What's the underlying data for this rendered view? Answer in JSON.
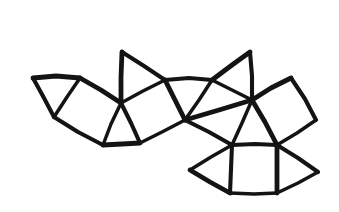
{
  "figure": {
    "style": "hand-drawn line art",
    "background_color": "#ffffff",
    "ink_color": "#141414",
    "stroke_width": 4.1,
    "canvas": {
      "width": 339,
      "height": 212
    }
  },
  "geometry": {
    "vertices": {
      "a": [
        33,
        78
      ],
      "b": [
        80,
        78
      ],
      "c": [
        54,
        117
      ],
      "d": [
        103,
        145
      ],
      "e": [
        121,
        103
      ],
      "f": [
        140,
        143
      ],
      "g": [
        122,
        52
      ],
      "h": [
        165,
        80
      ],
      "i": [
        212,
        80
      ],
      "j": [
        250,
        52
      ],
      "k": [
        185,
        120
      ],
      "l": [
        252,
        100
      ],
      "m": [
        232,
        145
      ],
      "n": [
        291,
        78
      ],
      "o": [
        316,
        120
      ],
      "p": [
        277,
        145
      ],
      "q": [
        190,
        170
      ],
      "r": [
        230,
        193
      ],
      "s": [
        277,
        193
      ],
      "t": [
        318,
        172
      ]
    },
    "faces": [
      {
        "name": "triangle-far-left",
        "shape": "triangle",
        "points": "a,c,b"
      },
      {
        "name": "square-left",
        "shape": "square",
        "points": "b,e,d,c"
      },
      {
        "name": "triangle-left-lower",
        "shape": "triangle",
        "points": "e,f,d"
      },
      {
        "name": "square-center-left",
        "shape": "square",
        "points": "e,h,k,f"
      },
      {
        "name": "triangle-upper-left",
        "shape": "triangle",
        "points": "g,h,e"
      },
      {
        "name": "square-top",
        "shape": "square",
        "points": "h,i,l,k"
      },
      {
        "name": "triangle-top-left",
        "shape": "triangle",
        "points": "g,h,k"
      },
      {
        "name": "triangle-top-right",
        "shape": "triangle",
        "points": "i,j,l"
      },
      {
        "name": "triangle-center",
        "shape": "triangle",
        "points": "h,i,k"
      },
      {
        "name": "square-right",
        "shape": "square",
        "points": "l,n,o,p"
      },
      {
        "name": "triangle-right-lower",
        "shape": "triangle",
        "points": "l,m,p"
      },
      {
        "name": "square-bottom",
        "shape": "square",
        "points": "m,p,s,r"
      },
      {
        "name": "triangle-bottom-left",
        "shape": "triangle",
        "points": "m,q,r"
      },
      {
        "name": "triangle-bottom-right",
        "shape": "triangle",
        "points": "p,t,s"
      }
    ],
    "edges": [
      {
        "name": "edge-a-b",
        "d": "M 33,78 L 56,76 L 80,78"
      },
      {
        "name": "edge-a-c",
        "d": "M 33,78 L 44,98 L 54,117"
      },
      {
        "name": "edge-c-b",
        "d": "M 54,117 L 67,97 L 80,78"
      },
      {
        "name": "edge-b-e",
        "d": "M 80,78 L 101,90 L 121,103"
      },
      {
        "name": "edge-c-d",
        "d": "M 54,117 L 78,132 L 103,145"
      },
      {
        "name": "edge-e-d",
        "d": "M 121,103 L 111,124 L 103,145"
      },
      {
        "name": "edge-d-f",
        "d": "M 103,145 L 122,144 L 140,143"
      },
      {
        "name": "edge-e-f",
        "d": "M 121,103 L 131,123 L 140,143"
      },
      {
        "name": "edge-e-h",
        "d": "M 121,103 L 143,91 L 165,80"
      },
      {
        "name": "edge-e-g",
        "d": "M 121,103 L 121,77 L 122,52"
      },
      {
        "name": "edge-g-h",
        "d": "M 122,52 L 144,66 L 165,80"
      },
      {
        "name": "edge-f-k",
        "d": "M 140,143 L 162,132 L 185,120"
      },
      {
        "name": "edge-h-k",
        "d": "M 165,80 L 175,100 L 185,120"
      },
      {
        "name": "edge-h-i",
        "d": "M 165,80 L 189,78 L 212,80"
      },
      {
        "name": "edge-i-k",
        "d": "M 212,80 L 199,100 L 185,120"
      },
      {
        "name": "edge-i-j",
        "d": "M 212,80 L 232,65 L 250,52"
      },
      {
        "name": "edge-j-l",
        "d": "M 250,52 L 252,76 L 252,100"
      },
      {
        "name": "edge-i-l",
        "d": "M 212,80 L 232,90 L 252,100"
      },
      {
        "name": "edge-k-l",
        "d": "M 185,120 L 219,110 L 252,100"
      },
      {
        "name": "edge-k-m",
        "d": "M 185,120 L 209,132 L 232,145"
      },
      {
        "name": "edge-l-m",
        "d": "M 252,100 L 242,123 L 232,145"
      },
      {
        "name": "edge-l-n",
        "d": "M 252,100 L 271,88 L 291,78"
      },
      {
        "name": "edge-n-o",
        "d": "M 291,78 L 305,99 L 316,120"
      },
      {
        "name": "edge-o-p",
        "d": "M 316,120 L 297,133 L 277,145"
      },
      {
        "name": "edge-l-p",
        "d": "M 252,100 L 265,122 L 277,145"
      },
      {
        "name": "edge-m-p",
        "d": "M 232,145 L 255,144 L 277,145"
      },
      {
        "name": "edge-m-q",
        "d": "M 232,145 L 211,157 L 190,170"
      },
      {
        "name": "edge-q-r",
        "d": "M 190,170 L 210,182 L 230,193"
      },
      {
        "name": "edge-m-r",
        "d": "M 232,145 L 231,169 L 230,193"
      },
      {
        "name": "edge-r-s",
        "d": "M 230,193 L 254,194 L 277,193"
      },
      {
        "name": "edge-p-s",
        "d": "M 277,145 L 277,169 L 277,193"
      },
      {
        "name": "edge-p-t",
        "d": "M 277,145 L 298,158 L 318,172"
      },
      {
        "name": "edge-t-s",
        "d": "M 318,172 L 298,183 L 277,193"
      }
    ]
  }
}
